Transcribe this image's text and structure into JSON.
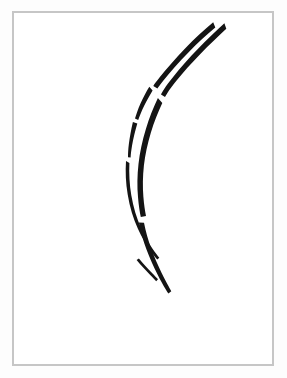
{
  "artwork": {
    "title": "Ink Brush Stroke Drawing",
    "medium": "ink-on-paper",
    "subject": "two-curved-brush-strokes",
    "background_color": "#ffffff",
    "outer_margin_color": "#fdfdfd",
    "ink_color": "#141414",
    "frame": {
      "name": "artwork-frame",
      "border_color": "#c6c6c6",
      "border_width_px": 2,
      "left_px": 12,
      "top_px": 11,
      "width_px": 262,
      "height_px": 355
    },
    "canvas": {
      "width_px": 287,
      "height_px": 378
    },
    "strokes": [
      {
        "name": "left-stroke",
        "description": "Inner thinner curved stroke, tapering, broken into four segments",
        "segment_count": 4,
        "top_point": [
          215,
          28
        ],
        "bottom_point": [
          157,
          281
        ]
      },
      {
        "name": "right-stroke",
        "description": "Outer thicker curved stroke, broken into three segments",
        "segment_count": 3,
        "top_point": [
          226,
          29
        ],
        "bottom_point": [
          163,
          294
        ]
      }
    ]
  }
}
